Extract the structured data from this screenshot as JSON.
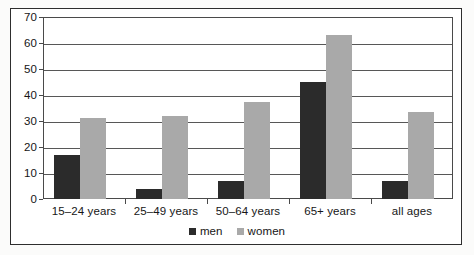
{
  "chart_data": {
    "type": "bar",
    "title": "",
    "subtitle": "",
    "xlabel": "",
    "ylabel": "",
    "categories": [
      "15–24 years",
      "25–49 years",
      "50–64 years",
      "65+ years",
      "all ages"
    ],
    "series": [
      {
        "name": "men",
        "color": "#2b2b2b",
        "values": [
          17,
          4,
          7,
          45,
          7
        ]
      },
      {
        "name": "women",
        "color": "#a9a9a9",
        "values": [
          31,
          32,
          37.5,
          63,
          33.5
        ]
      }
    ],
    "ylim": [
      0,
      70
    ],
    "ytick_step": 10,
    "ytick_labels": [
      "0",
      "10",
      "20",
      "30",
      "40",
      "50",
      "60",
      "70"
    ],
    "grid": true,
    "legend_position": "bottom-center",
    "legend_entries": [
      "men",
      "women"
    ],
    "annotations": []
  },
  "colors": {
    "men_bar": "#2b2b2b",
    "women_bar": "#a9a9a9",
    "gridline": "#575757",
    "axis": "#4a4a4a",
    "frame_border": "#2e2e2e",
    "page_background": "#fbfbfa",
    "plot_background": "#ffffff",
    "text": "#161616"
  }
}
